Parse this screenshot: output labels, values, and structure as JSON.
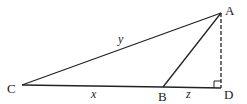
{
  "diagram": {
    "type": "geometry-triangle",
    "colors": {
      "stroke": "#222222",
      "background": "#ffffff"
    },
    "vertices": {
      "A": {
        "label": "A",
        "x": 221,
        "y": 13
      },
      "B": {
        "label": "B",
        "x": 163,
        "y": 87
      },
      "C": {
        "label": "C",
        "x": 22,
        "y": 85
      },
      "D": {
        "label": "D",
        "x": 221,
        "y": 88
      }
    },
    "segments": [
      {
        "from": "C",
        "to": "A",
        "style": "solid",
        "label": "y"
      },
      {
        "from": "C",
        "to": "B",
        "style": "solid",
        "label": "x"
      },
      {
        "from": "B",
        "to": "D",
        "style": "solid",
        "label": "z"
      },
      {
        "from": "B",
        "to": "A",
        "style": "solid",
        "label": ""
      },
      {
        "from": "A",
        "to": "D",
        "style": "dashed",
        "label": ""
      }
    ],
    "side_labels": {
      "y": "y",
      "x": "x",
      "z": "z"
    },
    "right_angle_at": "D"
  }
}
